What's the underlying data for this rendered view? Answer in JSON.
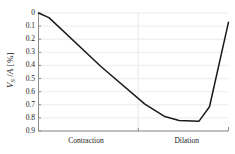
{
  "chart_data": {
    "type": "line",
    "title": "",
    "xlabel": "",
    "ylabel": "V_S /A [%]",
    "ylabel_parts": {
      "symbol": "V",
      "subscript": "S",
      "divider": " /",
      "denominator": "A",
      "units": " [%]"
    },
    "y_inverted": true,
    "ylim": [
      0,
      0.9
    ],
    "xlim": [
      0,
      1
    ],
    "grid": true,
    "grid_axis": "both",
    "legend": "none",
    "yticks": [
      0,
      0.1,
      0.2,
      0.3,
      0.4,
      0.5,
      0.6,
      0.7,
      0.8,
      0.9
    ],
    "ytick_labels": [
      "0",
      "0.1",
      "0.2",
      "0.3",
      "0.4",
      "0.5",
      "0.6",
      "0.7",
      "0.8",
      "0.9"
    ],
    "x_region_labels": [
      "Contraction",
      "Dilation"
    ],
    "x_region_centers": [
      0.25,
      0.78
    ],
    "x_divider": 0.525,
    "series": [
      {
        "name": "VS/A",
        "color": "#1a1a1a",
        "linewidth": 1.5,
        "x": [
          0.0,
          0.055,
          0.33,
          0.56,
          0.665,
          0.74,
          0.845,
          0.9,
          1.0
        ],
        "values": [
          0.0,
          0.035,
          0.41,
          0.695,
          0.79,
          0.82,
          0.825,
          0.715,
          0.07
        ]
      }
    ]
  },
  "colors": {
    "line": "#1a1a1a",
    "axis": "#808080",
    "grid": "#f0f0f2",
    "background": "#ffffff",
    "text": "#1a1a1a"
  }
}
